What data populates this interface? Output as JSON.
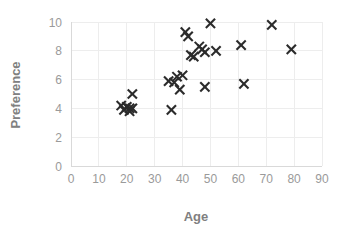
{
  "chart_data": {
    "type": "scatter",
    "title": "",
    "xlabel": "Age",
    "ylabel": "Preference",
    "xlim": [
      0,
      90
    ],
    "ylim": [
      0,
      10
    ],
    "xticks": [
      0,
      10,
      20,
      30,
      40,
      50,
      60,
      70,
      80,
      90
    ],
    "yticks": [
      0,
      2,
      4,
      6,
      8,
      10
    ],
    "xtick_labels": [
      "0",
      "10",
      "20",
      "30",
      "40",
      "50",
      "60",
      "70",
      "80",
      "90"
    ],
    "ytick_labels": [
      "0",
      "2",
      "4",
      "6",
      "8",
      "10"
    ],
    "grid": true,
    "legend": false,
    "marker_style": "x",
    "marker_color": "#2b2b2b",
    "points": [
      {
        "x": 18,
        "y": 4.2
      },
      {
        "x": 19,
        "y": 3.9
      },
      {
        "x": 20,
        "y": 4.1
      },
      {
        "x": 21,
        "y": 4.0
      },
      {
        "x": 21,
        "y": 3.8
      },
      {
        "x": 22,
        "y": 4.0
      },
      {
        "x": 22,
        "y": 5.0
      },
      {
        "x": 35,
        "y": 5.9
      },
      {
        "x": 36,
        "y": 3.9
      },
      {
        "x": 37,
        "y": 5.8
      },
      {
        "x": 38,
        "y": 6.2
      },
      {
        "x": 39,
        "y": 5.3
      },
      {
        "x": 40,
        "y": 6.3
      },
      {
        "x": 41,
        "y": 9.3
      },
      {
        "x": 42,
        "y": 9.0
      },
      {
        "x": 43,
        "y": 7.7
      },
      {
        "x": 44,
        "y": 7.6
      },
      {
        "x": 46,
        "y": 8.3
      },
      {
        "x": 47,
        "y": 8.1
      },
      {
        "x": 48,
        "y": 7.9
      },
      {
        "x": 48,
        "y": 5.5
      },
      {
        "x": 50,
        "y": 9.9
      },
      {
        "x": 52,
        "y": 8.0
      },
      {
        "x": 61,
        "y": 8.4
      },
      {
        "x": 62,
        "y": 5.7
      },
      {
        "x": 72,
        "y": 9.8
      },
      {
        "x": 79,
        "y": 8.1
      }
    ]
  },
  "axes": {
    "x_title": "Age",
    "y_title": "Preference"
  }
}
